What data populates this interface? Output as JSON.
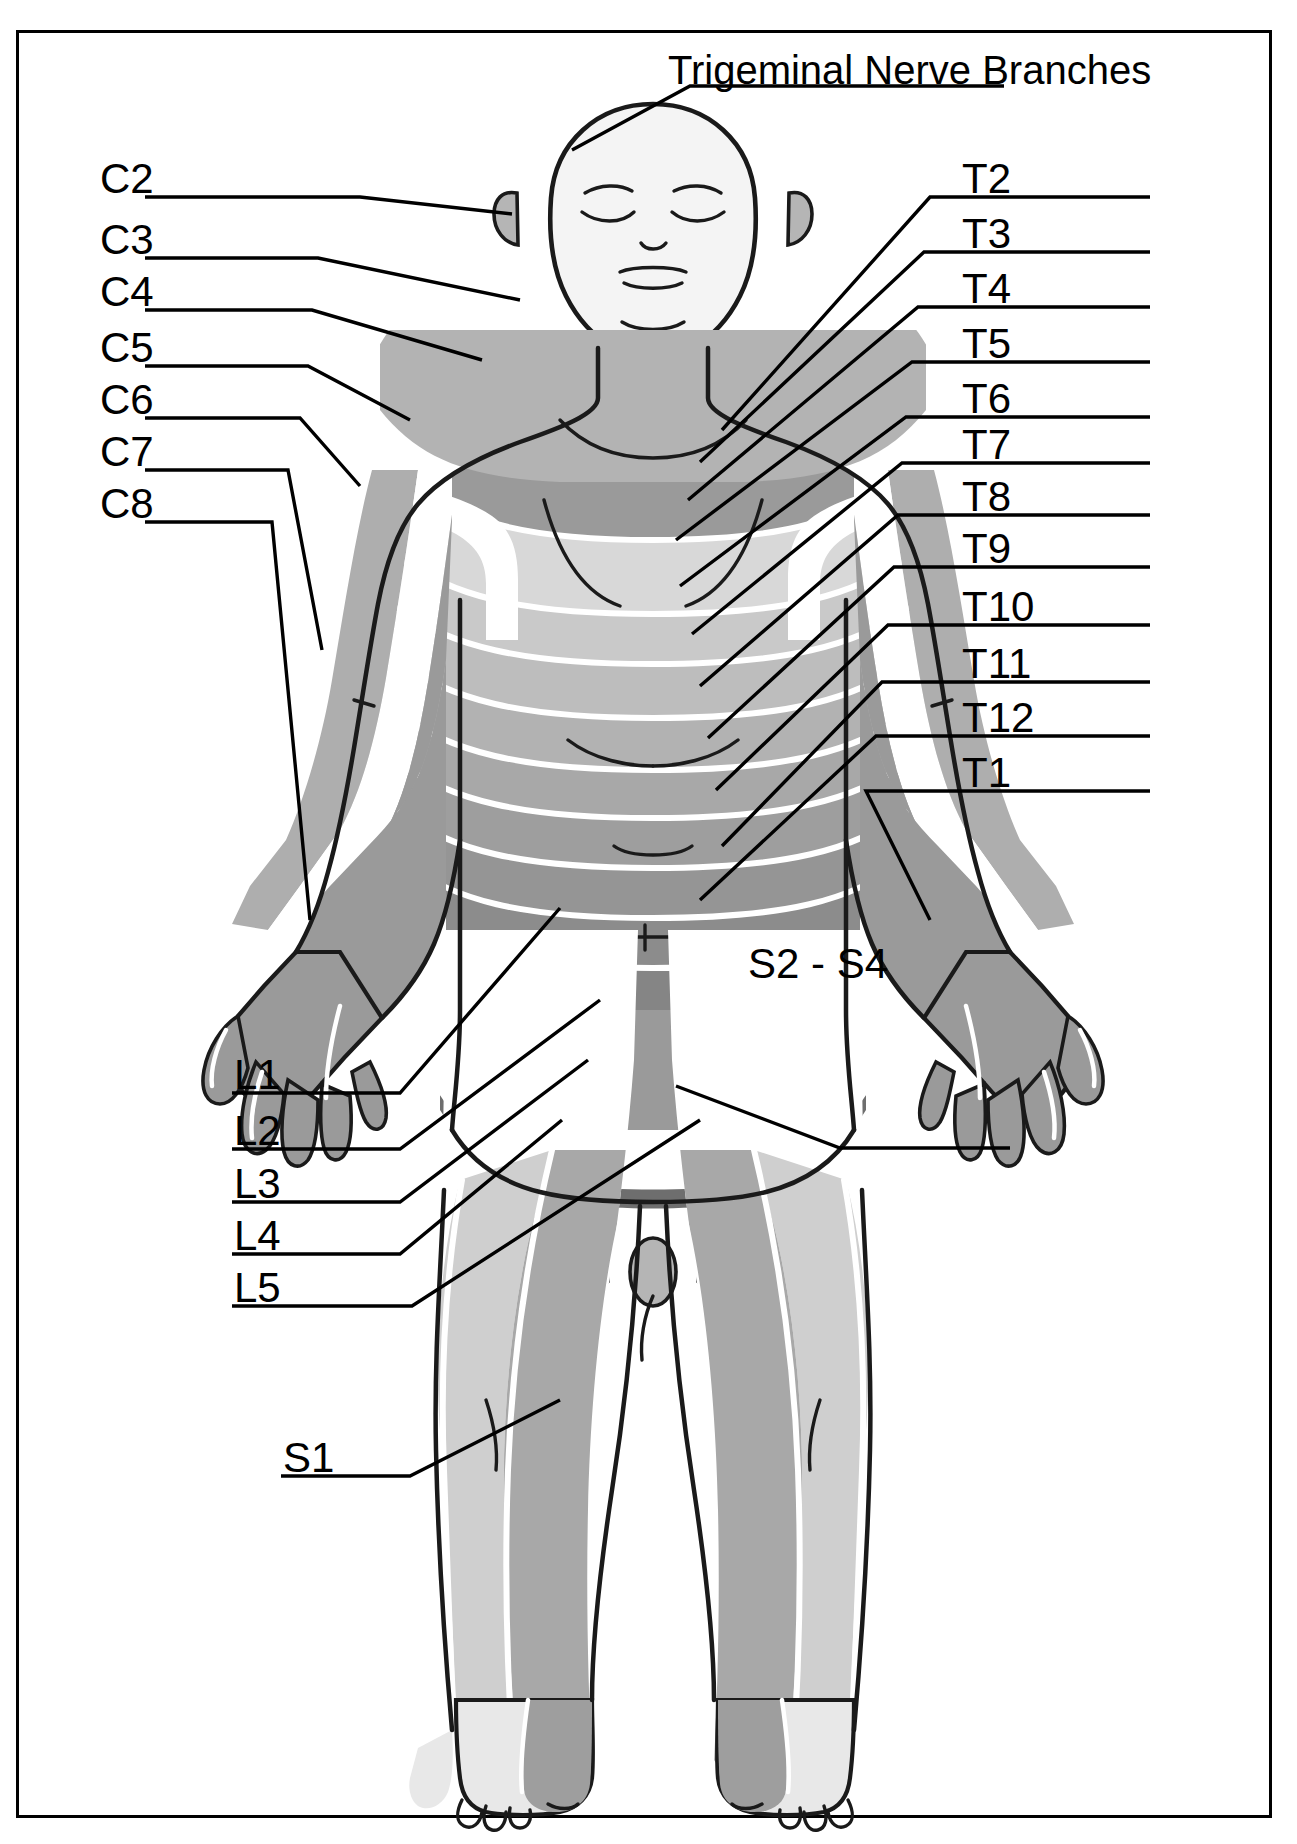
{
  "diagram": {
    "title_label": "Trigeminal Nerve Branches",
    "view": "anterior",
    "colors": {
      "outline": "#1a1a1a",
      "background": "#ffffff",
      "skin_light": "#f2f2f2",
      "band_white": "#ffffff",
      "grey_1": "#e0e0e0",
      "grey_2": "#cccccc",
      "grey_3": "#b5b5b5",
      "grey_4": "#a0a0a0",
      "grey_5": "#8e8e8e",
      "grey_6": "#7d7d7d",
      "leader_line": "#000000"
    },
    "frame": {
      "stroke": "#000000",
      "stroke_width": 3
    }
  },
  "labels": {
    "title": {
      "text": "Trigeminal Nerve Branches",
      "x": 668,
      "y": 48
    },
    "left": [
      {
        "text": "C2",
        "x": 100,
        "y": 158
      },
      {
        "text": "C3",
        "x": 100,
        "y": 219
      },
      {
        "text": "C4",
        "x": 100,
        "y": 271
      },
      {
        "text": "C5",
        "x": 100,
        "y": 327
      },
      {
        "text": "C6",
        "x": 100,
        "y": 379
      },
      {
        "text": "C7",
        "x": 100,
        "y": 431
      },
      {
        "text": "C8",
        "x": 100,
        "y": 483
      }
    ],
    "right": [
      {
        "text": "T2",
        "x": 962,
        "y": 158
      },
      {
        "text": "T3",
        "x": 962,
        "y": 213
      },
      {
        "text": "T4",
        "x": 962,
        "y": 268
      },
      {
        "text": "T5",
        "x": 962,
        "y": 323
      },
      {
        "text": "T6",
        "x": 962,
        "y": 378
      },
      {
        "text": "T7",
        "x": 962,
        "y": 424
      },
      {
        "text": "T8",
        "x": 962,
        "y": 476
      },
      {
        "text": "T9",
        "x": 962,
        "y": 528
      },
      {
        "text": "T10",
        "x": 962,
        "y": 586
      },
      {
        "text": "T11",
        "x": 962,
        "y": 643
      },
      {
        "text": "T12",
        "x": 962,
        "y": 697
      },
      {
        "text": "T1",
        "x": 962,
        "y": 752
      }
    ],
    "lower_left": [
      {
        "text": "L1",
        "x": 234,
        "y": 1054
      },
      {
        "text": "L2",
        "x": 234,
        "y": 1110
      },
      {
        "text": "L3",
        "x": 234,
        "y": 1163
      },
      {
        "text": "L4",
        "x": 234,
        "y": 1215
      },
      {
        "text": "L5",
        "x": 234,
        "y": 1267
      },
      {
        "text": "S1",
        "x": 283,
        "y": 1437
      }
    ],
    "lower_right": [
      {
        "text": "S2 - S4",
        "x": 748,
        "y": 943
      }
    ]
  },
  "dermatome_regions": [
    {
      "name": "trigeminal",
      "region": "face"
    },
    {
      "name": "C2",
      "region": "ear-and-posterior-scalp"
    },
    {
      "name": "C3",
      "region": "neck"
    },
    {
      "name": "C4",
      "region": "upper-shoulder"
    },
    {
      "name": "C5",
      "region": "lateral-upper-arm"
    },
    {
      "name": "C6",
      "region": "lateral-forearm-thumb"
    },
    {
      "name": "C7",
      "region": "middle-finger"
    },
    {
      "name": "C8",
      "region": "medial-hand-little-finger"
    },
    {
      "name": "T1",
      "region": "medial-forearm"
    },
    {
      "name": "T2",
      "region": "upper-chest-axilla"
    },
    {
      "name": "T3",
      "region": "chest"
    },
    {
      "name": "T4",
      "region": "nipple-line"
    },
    {
      "name": "T5",
      "region": "chest"
    },
    {
      "name": "T6",
      "region": "xiphoid"
    },
    {
      "name": "T7",
      "region": "upper-abdomen"
    },
    {
      "name": "T8",
      "region": "abdomen"
    },
    {
      "name": "T9",
      "region": "abdomen"
    },
    {
      "name": "T10",
      "region": "umbilicus"
    },
    {
      "name": "T11",
      "region": "lower-abdomen"
    },
    {
      "name": "T12",
      "region": "inguinal"
    },
    {
      "name": "L1",
      "region": "groin-upper-thigh"
    },
    {
      "name": "L2",
      "region": "anterior-thigh"
    },
    {
      "name": "L3",
      "region": "medial-knee"
    },
    {
      "name": "L4",
      "region": "medial-leg-ankle"
    },
    {
      "name": "L5",
      "region": "lateral-leg-dorsum-foot"
    },
    {
      "name": "S1",
      "region": "lateral-foot"
    },
    {
      "name": "S2 - S4",
      "region": "perineum"
    }
  ]
}
